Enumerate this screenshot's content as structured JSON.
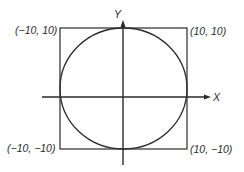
{
  "diagram": {
    "title": "",
    "axes": {
      "x_label": "X",
      "y_label": "Y"
    },
    "corners": {
      "top_left": "(−10, 10)",
      "top_right": "(10, 10)",
      "bottom_left": "(−10, −10)",
      "bottom_right": "(10, −10)"
    },
    "shapes": {
      "square": "square with corners (−10, 10), (10, 10), (10, −10), (−10, −10)",
      "circle": "circle centered at origin inscribed in square, radius 10"
    },
    "colors": {
      "stroke": "#2a2a2a",
      "background": "#ffffff"
    }
  }
}
